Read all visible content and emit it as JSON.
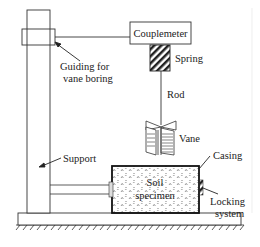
{
  "diagram": {
    "labels": {
      "couplemeter": "Couplemeter",
      "guiding_line1": "Guiding for",
      "guiding_line2": "vane boring",
      "spring": "Spring",
      "rod": "Rod",
      "vane": "Vane",
      "support": "Support",
      "casing": "Casing",
      "soil_line1": "Soil",
      "soil_line2": "specimen",
      "locking_line1": "Locking",
      "locking_line2": "system"
    },
    "colors": {
      "stroke": "#333333",
      "text": "#222222",
      "background": "#ffffff"
    }
  }
}
